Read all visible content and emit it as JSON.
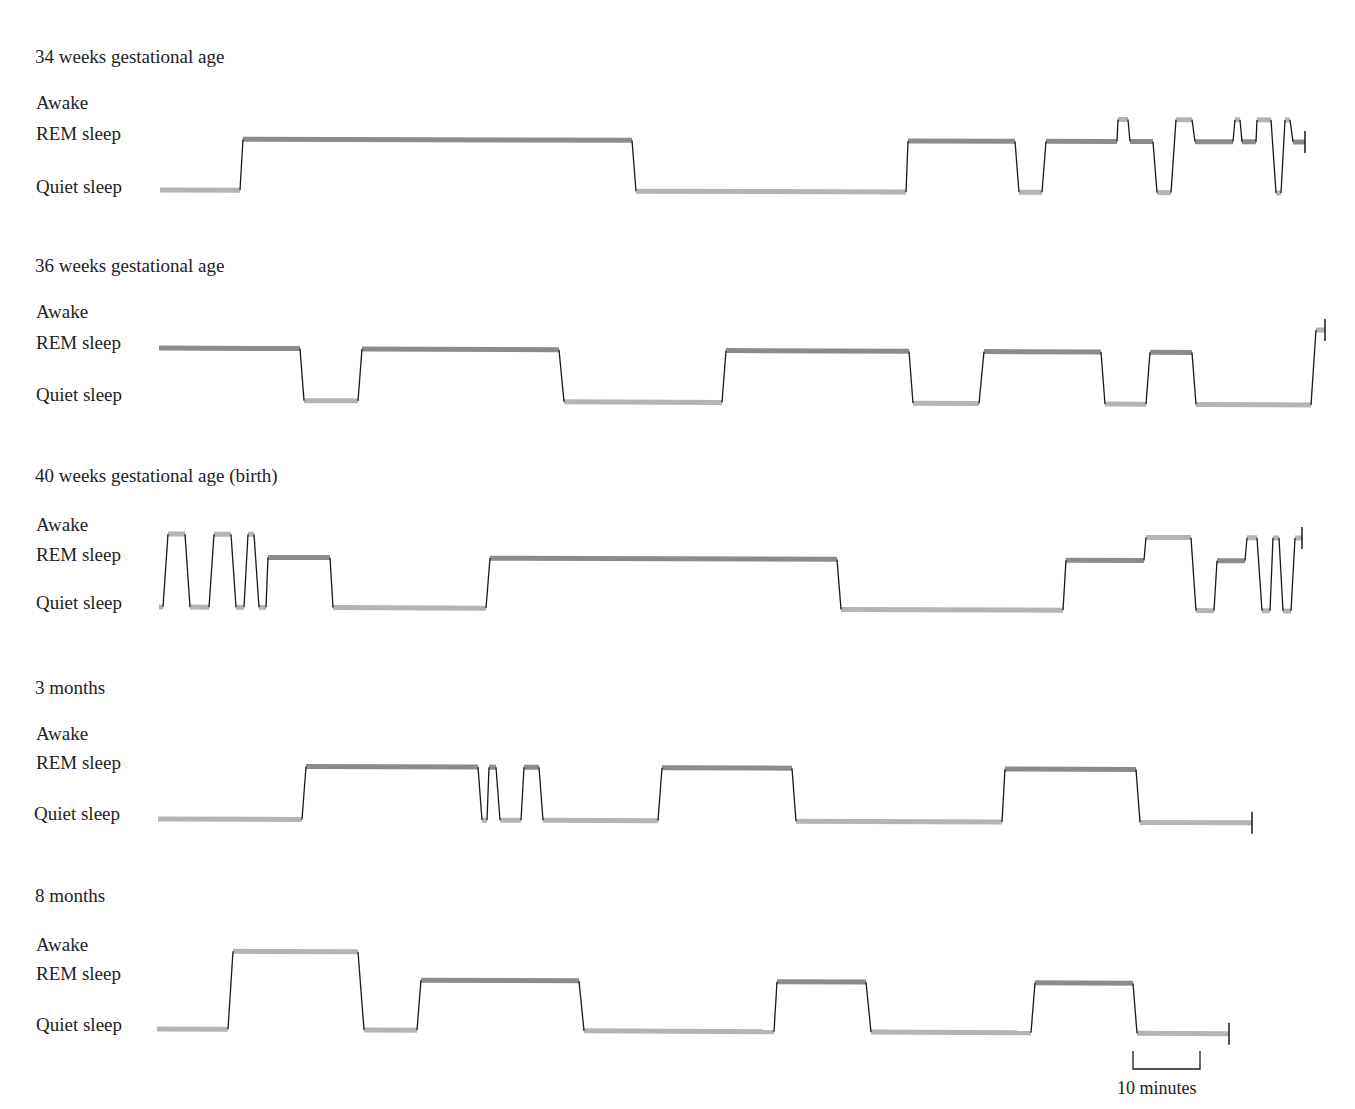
{
  "chart_data": {
    "type": "line",
    "subtype": "hypnogram-step",
    "title": "",
    "xlabel": "time",
    "ylabel": "sleep state",
    "states": [
      "Awake",
      "REM sleep",
      "Quiet sleep"
    ],
    "scale_bar": {
      "label": "10 minutes",
      "minutes": 10,
      "px": 67
    },
    "px_per_minute": 6.7,
    "colors": {
      "rem": "#8c8c8c",
      "awake": "#b4b4b4",
      "quiet": "#b4b4b4",
      "transition": "#1a1a1a"
    },
    "panels": [
      {
        "title": "34 weeks gestational age",
        "segments_px": [
          [
            "Quiet",
            160,
            240
          ],
          [
            "REM",
            243,
            632
          ],
          [
            "Quiet",
            636,
            906
          ],
          [
            "REM",
            908,
            1015
          ],
          [
            "Quiet",
            1019,
            1042
          ],
          [
            "REM",
            1046,
            1117
          ],
          [
            "Awake",
            1118,
            1128
          ],
          [
            "REM",
            1130,
            1153
          ],
          [
            "Quiet",
            1157,
            1171
          ],
          [
            "Awake",
            1176,
            1192
          ],
          [
            "REM",
            1195,
            1233
          ],
          [
            "Awake",
            1235,
            1240
          ],
          [
            "REM",
            1242,
            1256
          ],
          [
            "Awake",
            1257,
            1271
          ],
          [
            "Quiet",
            1276,
            1281
          ],
          [
            "Awake",
            1285,
            1290
          ],
          [
            "REM",
            1293,
            1305
          ]
        ]
      },
      {
        "title": "36 weeks gestational age",
        "segments_px": [
          [
            "REM",
            159,
            300
          ],
          [
            "Quiet",
            304,
            358
          ],
          [
            "REM",
            362,
            559
          ],
          [
            "Quiet",
            564,
            722
          ],
          [
            "REM",
            726,
            909
          ],
          [
            "Quiet",
            913,
            979
          ],
          [
            "REM",
            984,
            1101
          ],
          [
            "Quiet",
            1105,
            1146
          ],
          [
            "REM",
            1150,
            1192
          ],
          [
            "Quiet",
            1196,
            1311
          ],
          [
            "Awake",
            1316,
            1325
          ]
        ]
      },
      {
        "title": "40 weeks gestational age (birth)",
        "segments_px": [
          [
            "Quiet",
            159,
            163
          ],
          [
            "Awake",
            168,
            185
          ],
          [
            "Quiet",
            190,
            209
          ],
          [
            "Awake",
            214,
            231
          ],
          [
            "Quiet",
            236,
            244
          ],
          [
            "Awake",
            248,
            254
          ],
          [
            "Quiet",
            259,
            266
          ],
          [
            "REM",
            268,
            330
          ],
          [
            "Quiet",
            333,
            486
          ],
          [
            "REM",
            490,
            837
          ],
          [
            "Quiet",
            841,
            1063
          ],
          [
            "REM",
            1066,
            1144
          ],
          [
            "Awake",
            1146,
            1191
          ],
          [
            "Quiet",
            1196,
            1214
          ],
          [
            "REM",
            1217,
            1245
          ],
          [
            "Awake",
            1247,
            1257
          ],
          [
            "Quiet",
            1262,
            1270
          ],
          [
            "Awake",
            1273,
            1279
          ],
          [
            "Quiet",
            1283,
            1291
          ],
          [
            "Awake",
            1295,
            1302
          ]
        ]
      },
      {
        "title": "3 months",
        "segments_px": [
          [
            "Quiet",
            158,
            302
          ],
          [
            "REM",
            306,
            478
          ],
          [
            "Quiet",
            482,
            487
          ],
          [
            "REM",
            489,
            496
          ],
          [
            "Quiet",
            500,
            521
          ],
          [
            "REM",
            524,
            539
          ],
          [
            "Quiet",
            543,
            658
          ],
          [
            "REM",
            662,
            792
          ],
          [
            "Quiet",
            796,
            1002
          ],
          [
            "REM",
            1005,
            1136
          ],
          [
            "Quiet",
            1140,
            1252
          ]
        ]
      },
      {
        "title": "8 months",
        "segments_px": [
          [
            "Quiet",
            157,
            228
          ],
          [
            "Awake",
            233,
            358
          ],
          [
            "Quiet",
            364,
            417
          ],
          [
            "REM",
            421,
            579
          ],
          [
            "Quiet",
            584,
            774
          ],
          [
            "REM",
            777,
            866
          ],
          [
            "Quiet",
            871,
            1031
          ],
          [
            "REM",
            1035,
            1133
          ],
          [
            "Quiet",
            1137,
            1229
          ]
        ]
      }
    ]
  },
  "labels": {
    "awake": "Awake",
    "rem": "REM sleep",
    "quiet": "Quiet sleep",
    "scale": "10 minutes"
  },
  "panels": [
    {
      "title": "34 weeks gestational age"
    },
    {
      "title": "36 weeks gestational age"
    },
    {
      "title": "40 weeks gestational age (birth)"
    },
    {
      "title": "3 months"
    },
    {
      "title": "8 months"
    }
  ]
}
